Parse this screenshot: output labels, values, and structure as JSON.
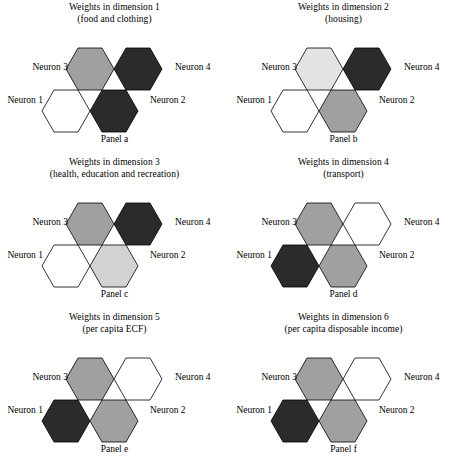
{
  "figure": {
    "neuron_labels": {
      "n1": "Neuron 1",
      "n2": "Neuron 2",
      "n3": "Neuron 3",
      "n4": "Neuron 4"
    },
    "palette": {
      "white": "#ffffff",
      "very_light_gray": "#e3e3e3",
      "light_gray": "#d2d2d2",
      "medium_gray": "#a0a0a0",
      "near_black": "#2b2b2b",
      "outline": "#000000"
    },
    "panels": [
      {
        "id": "a",
        "title_line1": "Weights in dimension 1",
        "title_line2": "(food and clothing)",
        "caption": "Panel a",
        "cells": {
          "n3": "#a0a0a0",
          "n4": "#2b2b2b",
          "n1": "#ffffff",
          "n2": "#2b2b2b"
        },
        "cell_shades": {
          "n3": "medium_gray",
          "n4": "near_black",
          "n1": "white",
          "n2": "near_black"
        }
      },
      {
        "id": "b",
        "title_line1": "Weights in dimension 2",
        "title_line2": "(housing)",
        "caption": "Panel b",
        "cells": {
          "n3": "#e3e3e3",
          "n4": "#2b2b2b",
          "n1": "#ffffff",
          "n2": "#a0a0a0"
        },
        "cell_shades": {
          "n3": "very_light_gray",
          "n4": "near_black",
          "n1": "white",
          "n2": "medium_gray"
        }
      },
      {
        "id": "c",
        "title_line1": "Weights in dimension 3",
        "title_line2": "(health, education and recreation)",
        "caption": "Panel c",
        "cells": {
          "n3": "#a0a0a0",
          "n4": "#2b2b2b",
          "n1": "#ffffff",
          "n2": "#d2d2d2"
        },
        "cell_shades": {
          "n3": "medium_gray",
          "n4": "near_black",
          "n1": "white",
          "n2": "light_gray"
        }
      },
      {
        "id": "d",
        "title_line1": "Weights in dimension 4",
        "title_line2": "(transport)",
        "caption": "Panel d",
        "cells": {
          "n3": "#a0a0a0",
          "n4": "#ffffff",
          "n1": "#2b2b2b",
          "n2": "#a0a0a0"
        },
        "cell_shades": {
          "n3": "medium_gray",
          "n4": "white",
          "n1": "near_black",
          "n2": "medium_gray"
        }
      },
      {
        "id": "e",
        "title_line1": "Weights in dimension 5",
        "title_line2": "(per capita ECF)",
        "caption": "Panel e",
        "cells": {
          "n3": "#a0a0a0",
          "n4": "#ffffff",
          "n1": "#2b2b2b",
          "n2": "#a0a0a0"
        },
        "cell_shades": {
          "n3": "medium_gray",
          "n4": "white",
          "n1": "near_black",
          "n2": "medium_gray"
        }
      },
      {
        "id": "f",
        "title_line1": "Weights in dimension 6",
        "title_line2": "(per capita disposable income)",
        "caption": "Panel f",
        "cells": {
          "n3": "#a0a0a0",
          "n4": "#ffffff",
          "n1": "#2b2b2b",
          "n2": "#a0a0a0"
        },
        "cell_shades": {
          "n3": "medium_gray",
          "n4": "white",
          "n1": "near_black",
          "n2": "medium_gray"
        }
      }
    ]
  }
}
